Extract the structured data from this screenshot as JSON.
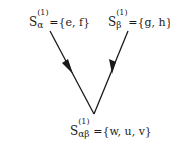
{
  "diagram": {
    "nodes": [
      {
        "id": "s_alpha",
        "symbol": "S",
        "superscript": "(1)",
        "subscript": "α",
        "set": "={e, f}"
      },
      {
        "id": "s_beta",
        "symbol": "S",
        "superscript": "(1)",
        "subscript": "β",
        "set": "={g, h}"
      },
      {
        "id": "s_alphabeta",
        "symbol": "S",
        "superscript": "(1)",
        "subscript": "αβ",
        "set": "={w, u, v}"
      }
    ],
    "edges": [
      {
        "from": "s_alpha",
        "to": "s_alphabeta",
        "arrow": "mid"
      },
      {
        "from": "s_beta",
        "to": "s_alphabeta",
        "arrow": "mid"
      }
    ],
    "colors": {
      "line": "#1a1a1a",
      "background": "#ffffff"
    }
  }
}
